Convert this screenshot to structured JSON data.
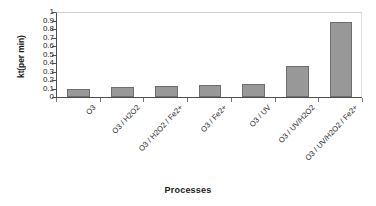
{
  "chart_data": {
    "type": "bar",
    "title": "",
    "xlabel": "Processes",
    "ylabel": "kt(per  min)",
    "categories": [
      "O3",
      "O3 / H2O2",
      "O3 / H2O2 / Fe2+",
      "O3 / Fe2+",
      "O3 / UV",
      "O3 / UV/H2O2",
      "O3 / UV/H2O2 / Fe2+"
    ],
    "values": [
      0.1,
      0.12,
      0.13,
      0.14,
      0.15,
      0.37,
      0.88
    ],
    "ylim": [
      0,
      1
    ],
    "ytick_labels": [
      "1",
      "0.9",
      "0.8",
      "0.7",
      "0.6",
      "0.5",
      "0.4",
      "0.3",
      "0.2",
      "0.1",
      "0"
    ],
    "ytick_values": [
      1,
      0.9,
      0.8,
      0.7,
      0.6,
      0.5,
      0.4,
      0.3,
      0.2,
      0.1,
      0
    ],
    "grid": false,
    "legend": false,
    "bar_color": "#989898",
    "bar_border_color": "#6e6e6e",
    "axis_color": "#4d4d4d"
  }
}
